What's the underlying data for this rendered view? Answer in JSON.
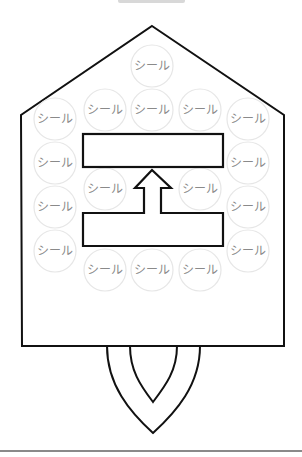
{
  "diagram": {
    "type": "sticker-chart-house",
    "colors": {
      "outline": "#111111",
      "seal_border": "#e6e6e6",
      "seal_text": "#8a8a8a",
      "background": "#ffffff"
    },
    "house": {
      "apex": [
        152,
        26
      ],
      "left_shoulder": [
        21,
        115
      ],
      "right_shoulder": [
        284,
        115
      ],
      "bottom_left": [
        22,
        346
      ],
      "bottom_right": [
        284,
        346
      ]
    },
    "upper_box": {
      "x": 83,
      "y": 134,
      "w": 140,
      "h": 33,
      "text": ""
    },
    "lower_box": {
      "x": 83,
      "y": 213,
      "w": 140,
      "h": 33,
      "text": ""
    },
    "arrow": {
      "direction": "up",
      "tip": [
        152,
        170
      ]
    },
    "seals": [
      {
        "label": "シール",
        "cx": 152,
        "cy": 66
      },
      {
        "label": "シール",
        "cx": 105,
        "cy": 110
      },
      {
        "label": "シール",
        "cx": 152,
        "cy": 110
      },
      {
        "label": "シール",
        "cx": 200,
        "cy": 110
      },
      {
        "label": "シール",
        "cx": 55,
        "cy": 119
      },
      {
        "label": "シール",
        "cx": 248,
        "cy": 119
      },
      {
        "label": "シール",
        "cx": 55,
        "cy": 163
      },
      {
        "label": "シール",
        "cx": 248,
        "cy": 163
      },
      {
        "label": "シール",
        "cx": 105,
        "cy": 189
      },
      {
        "label": "シール",
        "cx": 200,
        "cy": 189
      },
      {
        "label": "シール",
        "cx": 55,
        "cy": 207
      },
      {
        "label": "シール",
        "cx": 248,
        "cy": 207
      },
      {
        "label": "シール",
        "cx": 55,
        "cy": 251
      },
      {
        "label": "シール",
        "cx": 248,
        "cy": 251
      },
      {
        "label": "シール",
        "cx": 105,
        "cy": 270
      },
      {
        "label": "シール",
        "cx": 152,
        "cy": 270
      },
      {
        "label": "シール",
        "cx": 200,
        "cy": 270
      }
    ],
    "flame": {
      "outer_tip": [
        153,
        433
      ],
      "inner_tip": [
        153,
        402
      ]
    }
  }
}
